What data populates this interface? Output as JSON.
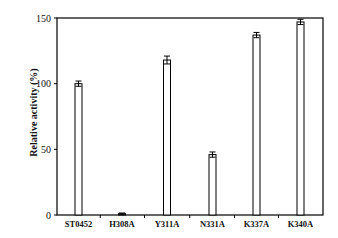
{
  "chart_data": {
    "type": "bar",
    "title": "",
    "xlabel": "",
    "ylabel": "Relative activity (%)",
    "ylim": [
      0,
      150
    ],
    "yticks": [
      0,
      50,
      100,
      150
    ],
    "grid": false,
    "legend": null,
    "categories": [
      "ST0452",
      "H308A",
      "Y311A",
      "N331A",
      "K337A",
      "K340A"
    ],
    "values": [
      100,
      1,
      118,
      46,
      137,
      147
    ],
    "errors": [
      2,
      0.5,
      3,
      2,
      2,
      2
    ],
    "bar_fill": "#ffffff",
    "bar_stroke": "#000000"
  }
}
